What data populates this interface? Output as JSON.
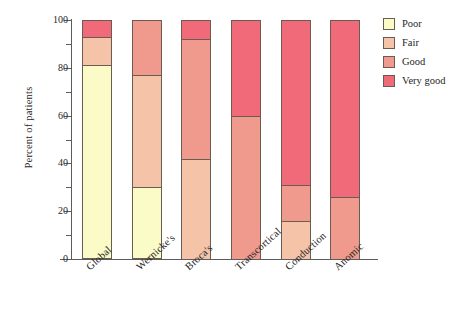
{
  "chart_data": {
    "type": "bar",
    "stacked": true,
    "title": "",
    "xlabel": "",
    "ylabel": "Percent of patients",
    "ylim": [
      0,
      100
    ],
    "grid": false,
    "legend_position": "right",
    "categories": [
      "Global",
      "Wernicke's",
      "Broca's",
      "Transcortical",
      "Conduction",
      "Anomic"
    ],
    "y_ticks_major": [
      0,
      20,
      40,
      60,
      80,
      100
    ],
    "y_tick_labels": [
      "0",
      "20",
      "40",
      "60",
      "80",
      "100"
    ],
    "y_ticks_minor": [
      10,
      30,
      50,
      70,
      90
    ],
    "series": [
      {
        "name": "Poor",
        "color": "#fbfbc8",
        "values": [
          81,
          30,
          0,
          0,
          0,
          0
        ]
      },
      {
        "name": "Fair",
        "color": "#f5c3a8",
        "values": [
          12,
          47,
          42,
          0,
          16,
          0
        ]
      },
      {
        "name": "Good",
        "color": "#ef9a8c",
        "values": [
          0,
          23,
          50,
          60,
          15,
          26
        ]
      },
      {
        "name": "Very good",
        "color": "#f06a7a",
        "values": [
          7,
          0,
          8,
          40,
          69,
          74
        ]
      }
    ],
    "cumulative_tops": {
      "Global": [
        81,
        93,
        93,
        100
      ],
      "Wernicke's": [
        30,
        77,
        100,
        100
      ],
      "Broca's": [
        0,
        42,
        92,
        100
      ],
      "Transcortical": [
        0,
        0,
        60,
        100
      ],
      "Conduction": [
        0,
        16,
        31,
        100
      ],
      "Anomic": [
        0,
        0,
        26,
        100
      ]
    }
  },
  "legend": {
    "items": [
      {
        "label": "Poor"
      },
      {
        "label": "Fair"
      },
      {
        "label": "Good"
      },
      {
        "label": "Very good"
      }
    ]
  },
  "axes": {
    "y_title": "Percent of patients"
  }
}
